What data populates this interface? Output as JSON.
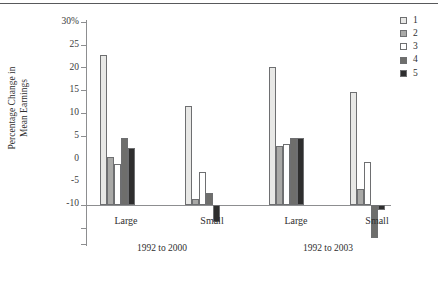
{
  "chart_data": {
    "type": "bar",
    "title": "",
    "xlabel": "",
    "ylabel": "Percentage Change in Mean Earnings",
    "ylabel_lines": [
      "Percentage Change in",
      "Mean Earnings"
    ],
    "ylim": [
      -10,
      30
    ],
    "yticks": [
      30,
      25,
      20,
      15,
      10,
      5,
      0,
      -5,
      -10
    ],
    "ytick_labels": [
      "30%",
      "25",
      "20",
      "15",
      "10",
      "5",
      "0",
      "-5",
      "-10"
    ],
    "grid": false,
    "legend_position": "top-right",
    "legend": [
      "1",
      "2",
      "3",
      "4",
      "5"
    ],
    "series_colors": [
      "#e8e8e6",
      "#a9a9a7",
      "#ffffff",
      "#6e6e6c",
      "#2e2e2e"
    ],
    "categories": [
      "Large",
      "Small",
      "Large",
      "Small"
    ],
    "group_labels": [
      "1992 to 2000",
      "1992 to 2003"
    ],
    "series": [
      {
        "name": "1",
        "values": [
          24.4,
          16.0,
          22.3,
          18.4
        ]
      },
      {
        "name": "2",
        "values": [
          7.8,
          1.0,
          9.5,
          2.6
        ]
      },
      {
        "name": "3",
        "values": [
          6.6,
          5.4,
          9.9,
          6.9
        ]
      },
      {
        "name": "4",
        "values": [
          10.9,
          1.9,
          10.9,
          -5.4
        ]
      },
      {
        "name": "5",
        "values": [
          9.3,
          -2.8,
          10.8,
          -0.8
        ]
      }
    ]
  },
  "axis": {
    "y_title_line1": "Percentage Change in",
    "y_title_line2": "Mean Earnings",
    "ytick_0": "30%",
    "ytick_1": "25",
    "ytick_2": "20",
    "ytick_3": "15",
    "ytick_4": "10",
    "ytick_5": "5",
    "ytick_6": "0",
    "ytick_7": "-5",
    "ytick_8": "-10",
    "cat_0": "Large",
    "cat_1": "Small",
    "cat_2": "Large",
    "cat_3": "Small",
    "period_0": "1992 to 2000",
    "period_1": "1992 to 2003"
  },
  "legend": {
    "items": [
      {
        "label": "1",
        "color": "#e8e8e6"
      },
      {
        "label": "2",
        "color": "#a9a9a7"
      },
      {
        "label": "3",
        "color": "#ffffff"
      },
      {
        "label": "4",
        "color": "#6e6e6c"
      },
      {
        "label": "5",
        "color": "#2e2e2e"
      }
    ]
  }
}
